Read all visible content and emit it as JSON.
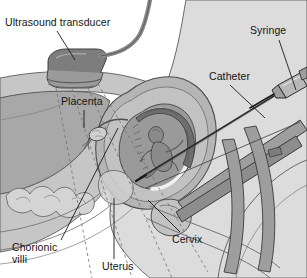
{
  "figure": {
    "style": "grayscale medical line illustration",
    "background_color": "#ffffff"
  },
  "labels": {
    "ultrasound_transducer": "Ultrasound transducer",
    "syringe": "Syringe",
    "catheter": "Catheter",
    "placenta": "Placenta",
    "cervix": "Cervix",
    "uterus": "Uterus",
    "chorionic_villi_line1": "Chorionic",
    "chorionic_villi_line2": "villi"
  },
  "colors": {
    "label_text": "#131313",
    "leader_line": "#1a1a1a",
    "outline": "#4d4d4d",
    "body_light": "#dcdcdc",
    "body_mid": "#c6c6c6",
    "body_dark": "#a8a8a8",
    "body_darker": "#8f8f8f",
    "uterus_wall": "#b5b5b5",
    "amniotic_cavity": "#9a9a9a",
    "placenta_band": "#6e6e6e",
    "cavity_highlight": "#f2f2f2",
    "instrument_gray": "#9e9e9e",
    "instrument_dark": "#5a5a5a",
    "transducer": "#7d7d7d",
    "needle": "#2b2b2b",
    "beam_dashed": "#707070"
  },
  "anatomy_parts": [
    "maternal abdominal wall",
    "uterus",
    "uterine cavity",
    "fetus",
    "placenta",
    "chorionic villi",
    "cervix",
    "vagina",
    "bladder",
    "bowel loops",
    "ovary",
    "fallopian tube",
    "sacrum"
  ],
  "instruments": [
    "ultrasound transducer",
    "transducer cable",
    "ultrasound beam",
    "transcervical catheter",
    "syringe",
    "needle",
    "speculum"
  ]
}
